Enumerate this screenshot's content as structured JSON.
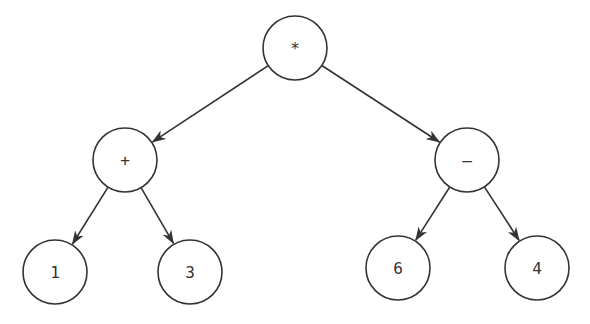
{
  "diagram": {
    "type": "expression-tree",
    "nodes": [
      {
        "id": "root",
        "label": "*",
        "cx": 295,
        "cy": 48
      },
      {
        "id": "plus",
        "label": "+",
        "cx": 125,
        "cy": 160
      },
      {
        "id": "minus",
        "label": "–",
        "cx": 467,
        "cy": 160
      },
      {
        "id": "n1",
        "label": "1",
        "cx": 55,
        "cy": 272
      },
      {
        "id": "n3",
        "label": "3",
        "cx": 190,
        "cy": 272
      },
      {
        "id": "n6",
        "label": "6",
        "cx": 398,
        "cy": 268
      },
      {
        "id": "n4",
        "label": "4",
        "cx": 537,
        "cy": 268
      }
    ],
    "edges": [
      {
        "from": "root",
        "to": "plus"
      },
      {
        "from": "root",
        "to": "minus"
      },
      {
        "from": "plus",
        "to": "n1"
      },
      {
        "from": "plus",
        "to": "n3"
      },
      {
        "from": "minus",
        "to": "n6"
      },
      {
        "from": "minus",
        "to": "n4"
      }
    ],
    "node_radius": 32,
    "stroke_color": "#333333"
  }
}
